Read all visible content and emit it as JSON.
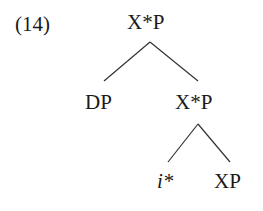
{
  "example_number": "(14)",
  "tree": {
    "root": "X*P",
    "left_child": "DP",
    "right_child": "X*P",
    "right_left_child": "i*",
    "right_right_child": "XP"
  },
  "colors": {
    "ink": "#1a1a1a",
    "background": "#ffffff"
  }
}
